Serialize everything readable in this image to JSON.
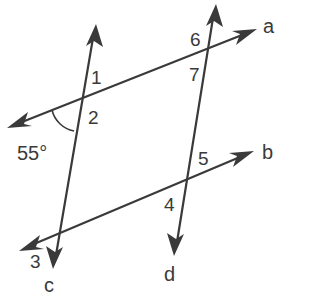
{
  "diagram": {
    "type": "parallel-lines-transversals",
    "lines": {
      "a": {
        "label": "a",
        "from": [
          8,
          127
        ],
        "to": [
          255,
          30
        ]
      },
      "b": {
        "label": "b",
        "from": [
          20,
          250
        ],
        "to": [
          252,
          152
        ]
      },
      "c": {
        "label": "c",
        "from": [
          95,
          25
        ],
        "to": [
          54,
          268
        ]
      },
      "d": {
        "label": "d",
        "from": [
          215,
          5
        ],
        "to": [
          175,
          255
        ]
      }
    },
    "line_labels": {
      "a": "a",
      "b": "b",
      "c": "c",
      "d": "d"
    },
    "angle_labels": {
      "1": "1",
      "2": "2",
      "3": "3",
      "4": "4",
      "5": "5",
      "6": "6",
      "7": "7"
    },
    "given_angle": {
      "value": "55°",
      "location": "between line a (left ray) and line c (downward ray) at intersection of a and c"
    },
    "colors": {
      "stroke": "#3a3a3a",
      "background": "#ffffff"
    }
  }
}
